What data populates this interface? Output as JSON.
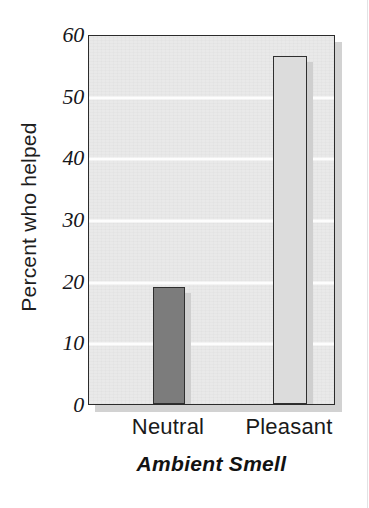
{
  "chart_data": {
    "type": "bar",
    "title": "",
    "categories": [
      "Neutral",
      "Pleasant"
    ],
    "values": [
      19,
      56.5
    ],
    "series": [
      {
        "name": "Percent who helped",
        "values": [
          19,
          56.5
        ]
      }
    ],
    "xlabel": "Ambient Smell",
    "ylabel": "Percent who helped",
    "ylim": [
      0,
      60
    ],
    "yticks": [
      0,
      10,
      20,
      30,
      40,
      50,
      60
    ],
    "ytick_labels": [
      "0",
      "10",
      "20",
      "30",
      "40",
      "50",
      "60"
    ],
    "grid": "horizontal",
    "legend": "none",
    "bar_colors": [
      "#7c7c7c",
      "#dcdcdc"
    ],
    "plot_background": "#e9e9e9",
    "gridline_color": "#fdfdfd",
    "axis_color": "#2b2b2b",
    "shadow_color": "#d2d2d2"
  }
}
